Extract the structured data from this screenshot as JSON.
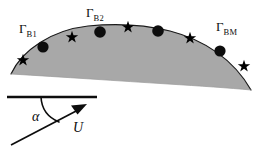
{
  "figure": {
    "colors": {
      "fill": "#a8a8a8",
      "stroke": "#1a1a1a",
      "marker": "#0d0d0d",
      "background": "#ffffff"
    },
    "labels": {
      "gamma_b1": {
        "symbol": "Γ",
        "subscript": "B1"
      },
      "gamma_b2": {
        "symbol": "Γ",
        "subscript": "B2"
      },
      "gamma_bm": {
        "symbol": "Γ",
        "subscript": "BM"
      },
      "alpha": "α",
      "velocity": "U"
    },
    "body": {
      "shape": "cambered-arc-segment",
      "fill_color": "#a8a8a8",
      "outline_color": "#1a1a1a",
      "apex": {
        "x": 128,
        "y": 26
      },
      "left_tip": {
        "x": 11,
        "y": 74
      },
      "right_tip": {
        "x": 251,
        "y": 90
      }
    },
    "markers": {
      "circle_label": "vortex-node",
      "circle_radius": 5.6,
      "circles": [
        {
          "x": 43,
          "y": 47
        },
        {
          "x": 100,
          "y": 32
        },
        {
          "x": 158,
          "y": 31
        },
        {
          "x": 220,
          "y": 51
        }
      ],
      "star_label": "control-point",
      "star_radius": 6.2,
      "stars": [
        {
          "x": 23,
          "y": 60
        },
        {
          "x": 72,
          "y": 37
        },
        {
          "x": 128,
          "y": 27
        },
        {
          "x": 190,
          "y": 38
        },
        {
          "x": 244,
          "y": 66
        }
      ]
    },
    "velocity_indicator": {
      "reference_line": {
        "x1": 7,
        "y1": 97,
        "x2": 97,
        "y2": 97
      },
      "arrow": {
        "x1": 11,
        "y1": 145,
        "x2": 85,
        "y2": 106
      },
      "angle_arc": "from reference line down to velocity vector",
      "angle_name": "alpha",
      "vector_name": "U"
    }
  }
}
